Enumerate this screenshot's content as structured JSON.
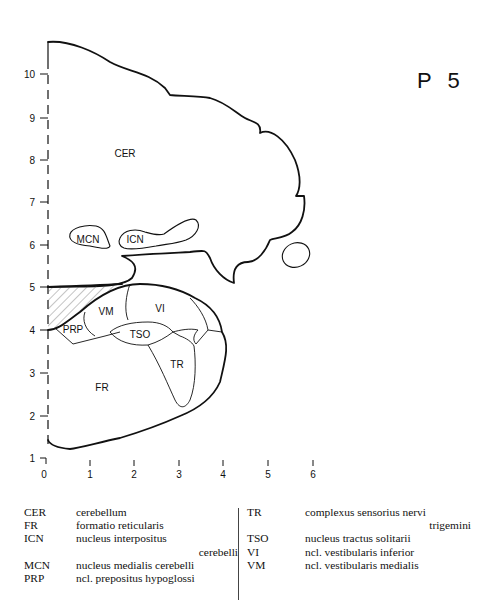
{
  "plate": {
    "label": "P 5"
  },
  "axes": {
    "y_ticks": [
      "1",
      "2",
      "3",
      "4",
      "5",
      "6",
      "7",
      "8",
      "9",
      "10"
    ],
    "x_ticks": [
      "0",
      "1",
      "2",
      "3",
      "4",
      "5",
      "6"
    ]
  },
  "regions": {
    "CER": "CER",
    "MCN": "MCN",
    "ICN": "ICN",
    "VM": "VM",
    "VI": "VI",
    "PRP": "PRP",
    "TSO": "TSO",
    "TR": "TR",
    "FR": "FR"
  },
  "legend": {
    "left": [
      {
        "abbr": "CER",
        "def": "cerebellum"
      },
      {
        "abbr": "FR",
        "def": "formatio reticularis"
      },
      {
        "abbr": "ICN",
        "def": "nucleus interpositus",
        "cont": "cerebelli"
      },
      {
        "abbr": "MCN",
        "def": "nucleus medialis cerebelli"
      },
      {
        "abbr": "PRP",
        "def": "ncl. prepositus hypoglossi"
      }
    ],
    "right": [
      {
        "abbr": "TR",
        "def": "complexus sensorius nervi",
        "cont": "trigemini"
      },
      {
        "abbr": "TSO",
        "def": "nucleus tractus solitarii"
      },
      {
        "abbr": "VI",
        "def": "ncl. vestibularis inferior"
      },
      {
        "abbr": "VM",
        "def": "ncl. vestibularis medialis"
      }
    ]
  }
}
